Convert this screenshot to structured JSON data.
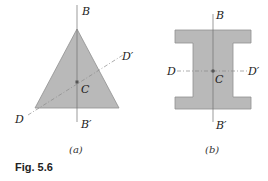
{
  "figure": {
    "caption": "Fig. 5.6",
    "colors": {
      "shape_fill": "#b9b9b9",
      "shape_stroke": "#8a8a8a",
      "axis": "#666666",
      "centroid": "#555555"
    },
    "panel_a": {
      "sublabel": "(a)",
      "shape": "triangle",
      "labels": {
        "top": "B",
        "bottom": "B′",
        "left": "D",
        "right": "D′",
        "centroid": "C"
      }
    },
    "panel_b": {
      "sublabel": "(b)",
      "shape": "I-section",
      "labels": {
        "top": "B",
        "bottom": "B′",
        "left": "D",
        "right": "D′",
        "centroid": "C"
      }
    }
  }
}
